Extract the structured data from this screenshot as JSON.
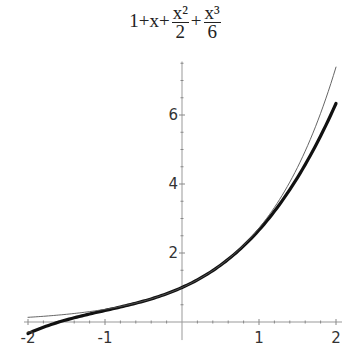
{
  "chart_data": {
    "type": "line",
    "title_parts": {
      "lead": "1+x+",
      "frac1_num": "x²",
      "frac1_den": "2",
      "plus": "+",
      "frac2_num": "x³",
      "frac2_den": "6"
    },
    "xlabel": "",
    "ylabel": "",
    "xlim": [
      -2,
      2
    ],
    "ylim": [
      -0.35,
      7.55
    ],
    "grid": false,
    "legend": null,
    "x_ticks": [
      -2,
      -1,
      1,
      2
    ],
    "x_tick_labels": [
      "-2",
      "-1",
      "1",
      "2"
    ],
    "y_ticks": [
      2,
      4,
      6
    ],
    "y_tick_labels": [
      "2",
      "4",
      "6"
    ],
    "series": [
      {
        "name": "1+x+x^2/2+x^3/6",
        "style": "thick",
        "color": "#111111",
        "x": [
          -2,
          -1.5,
          -1,
          -0.5,
          0,
          0.5,
          1,
          1.5,
          2
        ],
        "values": [
          -0.333,
          0.0625,
          0.333,
          0.604,
          1.0,
          1.646,
          2.667,
          4.188,
          6.333
        ]
      },
      {
        "name": "e^x",
        "style": "thin",
        "color": "#555555",
        "x": [
          -2,
          -1.5,
          -1,
          -0.5,
          0,
          0.5,
          1,
          1.5,
          2
        ],
        "values": [
          0.135,
          0.223,
          0.368,
          0.607,
          1.0,
          1.649,
          2.718,
          4.482,
          7.389
        ]
      }
    ]
  }
}
